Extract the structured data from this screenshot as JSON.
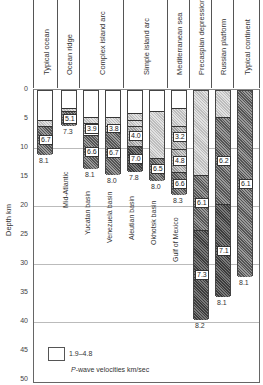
{
  "chart_data": {
    "type": "bar",
    "title": "",
    "xlabel": "",
    "ylabel": "Depth km",
    "ylim": [
      0,
      50
    ],
    "yticks": [
      0,
      5,
      10,
      15,
      20,
      25,
      30,
      35,
      40,
      45,
      50
    ],
    "inverted_y": true,
    "categories": [
      "Typical ocean",
      "Ocean ridge",
      "Complex island arc",
      "Simple island arc",
      "Mediterranean sea",
      "Precaspian depression",
      "Russian platform",
      "Typical continent"
    ],
    "columns": [
      {
        "group": "Typical ocean",
        "name": "",
        "layers": [
          {
            "top": 0,
            "bottom": 5,
            "v": "water"
          },
          {
            "top": 5,
            "bottom": 6,
            "v": "1.9-4.8"
          },
          {
            "top": 6,
            "bottom": 11,
            "v": "6.7"
          }
        ],
        "moho_velocity": "8.1",
        "depth": 11
      },
      {
        "group": "Ocean ridge",
        "name": "Mid-Atlantic",
        "layers": [
          {
            "top": 0,
            "bottom": 3,
            "v": "water"
          },
          {
            "top": 3,
            "bottom": 3.5,
            "v": "1.9-4.8"
          },
          {
            "top": 3.5,
            "bottom": 6,
            "v": "5.1"
          }
        ],
        "moho_velocity": "7.3",
        "depth": 6
      },
      {
        "group": "Complex island arc",
        "name": "Yucatan basin",
        "layers": [
          {
            "top": 0,
            "bottom": 4.5,
            "v": "water"
          },
          {
            "top": 4.5,
            "bottom": 5.5,
            "v": "1.9-4.8"
          },
          {
            "top": 5.5,
            "bottom": 7.5,
            "v": "3.9"
          },
          {
            "top": 7.5,
            "bottom": 13.5,
            "v": "6.6"
          }
        ],
        "moho_velocity": "8.1",
        "depth": 13.5
      },
      {
        "group": "Complex island arc",
        "name": "Venezuela basin",
        "layers": [
          {
            "top": 0,
            "bottom": 4.5,
            "v": "water"
          },
          {
            "top": 4.5,
            "bottom": 6,
            "v": "1.9-4.8"
          },
          {
            "top": 6,
            "bottom": 7,
            "v": "3.8"
          },
          {
            "top": 7,
            "bottom": 14.5,
            "v": "6.7"
          }
        ],
        "moho_velocity": "8.0",
        "depth": 14.5
      },
      {
        "group": "Simple island arc",
        "name": "Aleutian basin",
        "layers": [
          {
            "top": 0,
            "bottom": 3.8,
            "v": "water"
          },
          {
            "top": 3.8,
            "bottom": 5,
            "v": "1.9-4.8"
          },
          {
            "top": 5,
            "bottom": 6,
            "v": "1.9-4.8"
          },
          {
            "top": 6,
            "bottom": 9.5,
            "v": "4.0"
          },
          {
            "top": 9.5,
            "bottom": 14,
            "v": "7.0"
          }
        ],
        "moho_velocity": "7.8",
        "depth": 14
      },
      {
        "group": "Simple island arc",
        "name": "Okhotsk basin",
        "layers": [
          {
            "top": 0,
            "bottom": 3.5,
            "v": "water"
          },
          {
            "top": 3.5,
            "bottom": 11.5,
            "v": "1.9-4.8"
          },
          {
            "top": 11.5,
            "bottom": 15.5,
            "v": "6.5"
          }
        ],
        "moho_velocity": "8.0",
        "depth": 15.5
      },
      {
        "group": "Mediterranean sea",
        "name": "Gulf of Mexico",
        "layers": [
          {
            "top": 0,
            "bottom": 3,
            "v": "water"
          },
          {
            "top": 3,
            "bottom": 6,
            "v": "1.9-4.8"
          },
          {
            "top": 6,
            "bottom": 10,
            "v": "3.2"
          },
          {
            "top": 10,
            "bottom": 14,
            "v": "4.8"
          },
          {
            "top": 14,
            "bottom": 18,
            "v": "6.6"
          }
        ],
        "moho_velocity": "8.3",
        "depth": 18
      },
      {
        "group": "Precaspian depression",
        "name": "",
        "layers": [
          {
            "top": 0,
            "bottom": 14.5,
            "v": "1.9-4.8"
          },
          {
            "top": 14.5,
            "bottom": 24,
            "v": "6.1"
          },
          {
            "top": 24,
            "bottom": 39.5,
            "v": "7.3"
          }
        ],
        "moho_velocity": "8.2",
        "depth": 39.5
      },
      {
        "group": "Russian platform",
        "name": "",
        "layers": [
          {
            "top": 0,
            "bottom": 4.5,
            "v": "1.9-4.8"
          },
          {
            "top": 4.5,
            "bottom": 19.5,
            "v": "6.2"
          },
          {
            "top": 19.5,
            "bottom": 35.5,
            "v": "7.1"
          }
        ],
        "moho_velocity": "8.1",
        "depth": 35.5
      },
      {
        "group": "Typical continent",
        "name": "",
        "layers": [
          {
            "top": 0,
            "bottom": 32,
            "v": "6.1"
          }
        ],
        "moho_velocity": "8.1",
        "depth": 32
      }
    ],
    "legend": [
      {
        "pattern": "light stipple",
        "label": "1.9–4.8"
      }
    ],
    "annotation": "P-wave velocities km/sec"
  },
  "axis": {
    "ylabel": "Depth km",
    "ticks": [
      "0",
      "5",
      "10",
      "15",
      "20",
      "25",
      "30",
      "35",
      "40",
      "45",
      "50"
    ]
  },
  "headers": [
    "Typical ocean",
    "Ocean ridge",
    "Complex island arc",
    "Simple island arc",
    "Mediterranean sea",
    "Precaspian depression",
    "Russian platform",
    "Typical continent"
  ],
  "sublabels": [
    "Mid-Atlantic",
    "Yucatan basin",
    "Venezuela basin",
    "Aleutian basin",
    "Okhotsk basin",
    "Gulf of Mexico"
  ],
  "legend": {
    "label": "1.9–4.8",
    "caption_italic": "P",
    "caption": "-wave velocities km/sec"
  },
  "colors": {
    "water": "#ffffff",
    "light": "#cfcfcf",
    "mid": "#a9a9a9",
    "dark": "#6e6e6e",
    "darkest": "#4a4a4a",
    "frame": "#555555"
  }
}
